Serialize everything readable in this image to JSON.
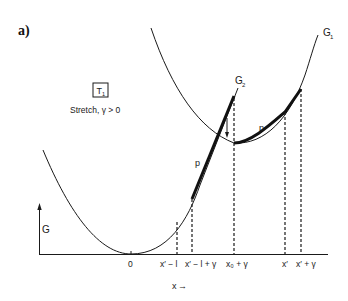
{
  "panel_label": "a)",
  "box": {
    "label": "T",
    "subscript": "1"
  },
  "condition": "Stretch, γ > 0",
  "axes": {
    "y_label": "G",
    "x_label": "x",
    "x_arrow": "→"
  },
  "curves": {
    "g1": {
      "label": "G",
      "subscript": "1"
    },
    "g2": {
      "label": "G",
      "subscript": "2"
    }
  },
  "tangent_labels": {
    "left": "p",
    "right": "p"
  },
  "ticks": [
    {
      "id": "origin",
      "label": "0"
    },
    {
      "id": "xl",
      "label": "x′ − l"
    },
    {
      "id": "xlg",
      "label": "x′ − l + γ"
    },
    {
      "id": "x0g",
      "label": "x₀ + γ"
    },
    {
      "id": "xp",
      "label": "x′"
    },
    {
      "id": "xpg",
      "label": "x′ + γ"
    }
  ],
  "colors": {
    "ink": "#1a1a1a",
    "background": "#ffffff"
  }
}
